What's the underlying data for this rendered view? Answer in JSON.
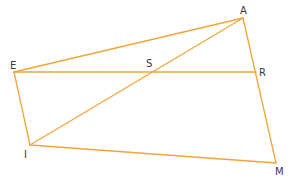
{
  "diagram": {
    "type": "geometry-figure",
    "line_color": "#f2a43a",
    "label_color": "#3a3a3a",
    "points": {
      "A": {
        "label": "A",
        "x": 243,
        "y": 18,
        "lx": 240,
        "ly": 14
      },
      "E": {
        "label": "E",
        "x": 14,
        "y": 72,
        "lx": 10,
        "ly": 69
      },
      "S": {
        "label": "S",
        "x": 151,
        "y": 72,
        "lx": 146,
        "ly": 67
      },
      "R": {
        "label": "R",
        "x": 256,
        "y": 72,
        "lx": 259,
        "ly": 76
      },
      "I": {
        "label": "I",
        "x": 30,
        "y": 145,
        "lx": 24,
        "ly": 158
      },
      "M": {
        "label": "M",
        "x": 276,
        "y": 163,
        "lx": 275,
        "ly": 175
      }
    },
    "segments": [
      {
        "from": "E",
        "to": "A"
      },
      {
        "from": "A",
        "to": "M"
      },
      {
        "from": "E",
        "to": "R"
      },
      {
        "from": "E",
        "to": "I"
      },
      {
        "from": "I",
        "to": "M"
      },
      {
        "from": "I",
        "to": "A"
      }
    ]
  }
}
